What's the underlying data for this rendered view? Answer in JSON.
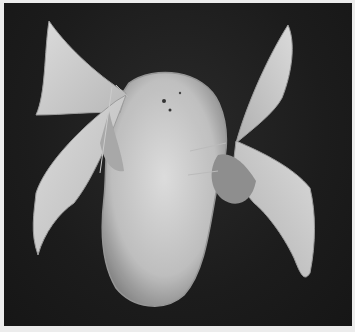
{
  "image": {
    "subject": "Two silk moths emerging on a silk cocoon",
    "style": "black-and-white photograph",
    "colors": {
      "border": "#ececec",
      "background": "#1c1c1c",
      "cocoon": "#d8d8d8",
      "wings": "#d0d0d0"
    }
  }
}
